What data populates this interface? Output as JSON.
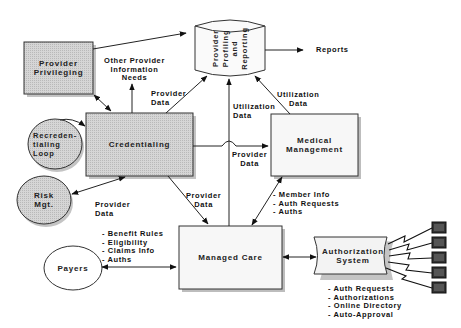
{
  "nodes": {
    "provider_privileging": {
      "line1": "Provider",
      "line2": "Privileging"
    },
    "credentialing": {
      "label": "Credentialing"
    },
    "recredentialing_loop": {
      "line1": "Recreden-",
      "line2": "tialing",
      "line3": "Loop"
    },
    "risk_mgt": {
      "line1": "Risk",
      "line2": "Mgt."
    },
    "provider_profiling": {
      "line1": "Provider",
      "line2": "Profiling",
      "line3": "and",
      "line4": "Reporting"
    },
    "medical_management": {
      "line1": "Medical",
      "line2": "Management"
    },
    "managed_care": {
      "label": "Managed Care"
    },
    "payers": {
      "label": "Payers"
    },
    "authorization_system": {
      "line1": "Authorization",
      "line2": "System"
    },
    "terminals": {
      "count": 5
    }
  },
  "edge_labels": {
    "other_provider_info": {
      "line1": "Other Provider",
      "line2": "Information",
      "line3": "Needs"
    },
    "provider_data_cred_to_profiling": {
      "line1": "Provider",
      "line2": "Data"
    },
    "utilization_data_mc_to_profiling": {
      "line1": "Utilization",
      "line2": "Data"
    },
    "utilization_data_mm_to_profiling": {
      "line1": "Utilization",
      "line2": "Data"
    },
    "provider_data_cred_to_mm": {
      "line1": "Provider",
      "line2": "Data"
    },
    "provider_data_cred_to_mc": {
      "line1": "Provider",
      "line2": "Data"
    },
    "provider_data_risk": {
      "line1": "Provider",
      "line2": "Data"
    },
    "reports": {
      "label": "Reports"
    },
    "mm_mc_items": [
      "- Member Info",
      "- Auth Requests",
      "- Auths"
    ],
    "payers_items": [
      "- Benefit Rules",
      "- Eligibility",
      "- Claims Info",
      "- Auths"
    ],
    "auth_items": [
      "- Auth Requests",
      "- Authorizations",
      "- Online Directory",
      "- Auto-Approval"
    ]
  },
  "colors": {
    "gray_fill": "#cfcfcf",
    "light_fill": "#f6f6f6",
    "shadow": "#bdbdbd",
    "stroke": "#222222",
    "terminal": "#3a3a3a"
  }
}
